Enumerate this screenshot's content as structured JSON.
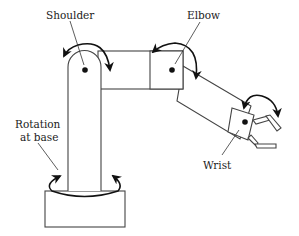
{
  "diagram": {
    "labels": {
      "shoulder": "Shoulder",
      "elbow": "Elbow",
      "wrist": "Wrist",
      "rotation_line1": "Rotation",
      "rotation_line2": "at base"
    },
    "joints": [
      "shoulder",
      "elbow",
      "wrist",
      "base-rotation"
    ],
    "colors": {
      "line": "#444444",
      "arrow": "#111111",
      "background": "#ffffff"
    }
  }
}
